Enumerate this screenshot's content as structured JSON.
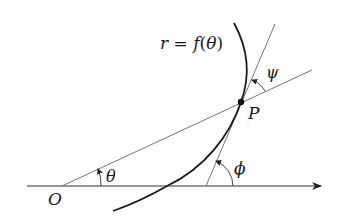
{
  "diagram": {
    "curve_label": {
      "lhs": "r",
      "eq": " = ",
      "fn": "f",
      "open": "(",
      "arg": "θ",
      "close": ")"
    },
    "point_label": "P",
    "origin_label": "O",
    "angles": {
      "theta": "θ",
      "phi": "ϕ",
      "psi": "ψ"
    },
    "colors": {
      "curve": "#1a1a1a",
      "lines": "#555555",
      "axis": "#333333",
      "text": "#1a1a1a"
    },
    "geometry": {
      "origin": [
        62,
        186
      ],
      "point_P": [
        241,
        102
      ],
      "axis": {
        "x1": 27,
        "x2": 323,
        "y": 186
      },
      "radius_line_end": [
        312,
        70
      ],
      "tangent_line": {
        "top": [
          275,
          24
        ],
        "axis_cross": [
          206,
          186
        ]
      },
      "curve": {
        "top": [
          234,
          23
        ],
        "bottom": [
          113,
          211
        ]
      }
    }
  }
}
